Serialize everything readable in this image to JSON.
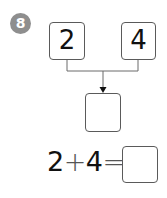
{
  "problem": {
    "number": "8",
    "badge_color": "#8e8e8e"
  },
  "diagram": {
    "left_value": "2",
    "right_value": "4",
    "result_value": "",
    "line_color": "#6a6a6a",
    "box_border_color": "#5a5a5a"
  },
  "equation": {
    "operand1": "2",
    "operator": "+",
    "operand2": "4",
    "equals": "=",
    "answer": ""
  }
}
